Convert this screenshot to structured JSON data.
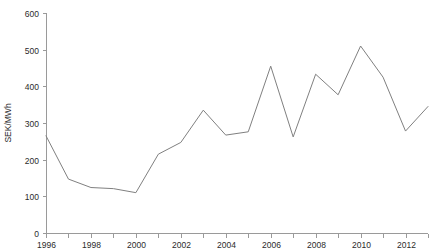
{
  "chart_data": {
    "type": "line",
    "title": "",
    "subtitle": "",
    "xlabel": "",
    "ylabel": "SEK/MWh",
    "ylim": [
      0,
      600
    ],
    "xlim": [
      1996,
      2013
    ],
    "ytick_step": 100,
    "grid": false,
    "legend": false,
    "legend_position": "none",
    "line_color": "#808080",
    "background_color": "#ffffff",
    "axis_color": "#9a9a9a",
    "text_color": "#2b2b2b",
    "x": [
      1996,
      1997,
      1998,
      1999,
      2000,
      2001,
      2002,
      2003,
      2004,
      2005,
      2006,
      2007,
      2008,
      2009,
      2010,
      2011,
      2012,
      2013
    ],
    "values": [
      265,
      147,
      124,
      121,
      110,
      215,
      247,
      335,
      267,
      276,
      455,
      262,
      433,
      377,
      510,
      425,
      278,
      345
    ],
    "series": [
      {
        "name": "SEK/MWh",
        "values": [
          265,
          147,
          124,
          121,
          110,
          215,
          247,
          335,
          267,
          276,
          455,
          262,
          433,
          377,
          510,
          425,
          278,
          345
        ]
      }
    ],
    "ytick_labels": [
      "0",
      "100",
      "200",
      "300",
      "400",
      "500",
      "600"
    ],
    "ytick_values": [
      0,
      100,
      200,
      300,
      400,
      500,
      600
    ],
    "xtick_values": [
      1996,
      1997,
      1998,
      1999,
      2000,
      2001,
      2002,
      2003,
      2004,
      2005,
      2006,
      2007,
      2008,
      2009,
      2010,
      2011,
      2012,
      2013
    ],
    "xtick_labels": [
      "1996",
      "",
      "1998",
      "",
      "2000",
      "",
      "2002",
      "",
      "2004",
      "",
      "2006",
      "",
      "2008",
      "",
      "2010",
      "",
      "2012",
      ""
    ],
    "annotations": []
  }
}
